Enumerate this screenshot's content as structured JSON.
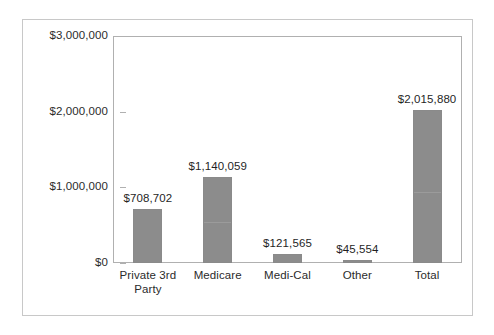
{
  "chart_data": {
    "type": "bar",
    "title": "",
    "xlabel": "",
    "ylabel": "",
    "categories": [
      "Private 3rd Party",
      "Medicare",
      "Medi-Cal",
      "Other",
      "Total"
    ],
    "values": [
      708702,
      1140059,
      121565,
      45554,
      2015880
    ],
    "value_labels": [
      "$708,702",
      "$1,140,059",
      "$121,565",
      "$45,554",
      "$2,015,880"
    ],
    "ylim": [
      0,
      3000000
    ],
    "ytick_values": [
      0,
      1000000,
      2000000,
      3000000
    ],
    "ytick_labels": [
      "$0",
      "$1,000,000",
      "$2,000,000",
      "$3,000,000"
    ],
    "grid": false,
    "legend": null,
    "bar_color": "#8c8c8c",
    "frame_color": "#b0b0b0",
    "outer_border_color": "#c8c8c8",
    "text_color": "#2b2b2b"
  }
}
